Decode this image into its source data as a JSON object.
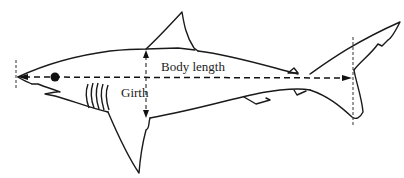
{
  "diagram": {
    "labels": {
      "body_length": "Body length",
      "girth": "Girth"
    },
    "colors": {
      "line": "#1a1a1a",
      "background": "#ffffff"
    }
  }
}
